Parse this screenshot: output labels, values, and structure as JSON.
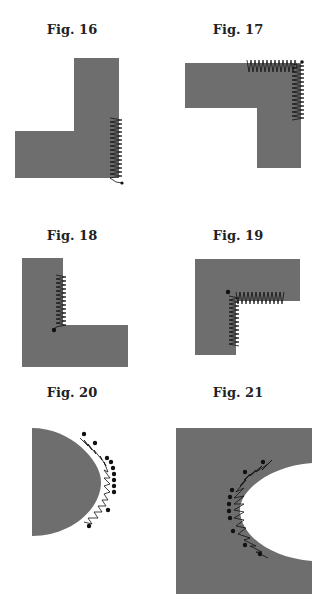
{
  "figures": [
    {
      "id": "fig16",
      "caption": "Fig. 16"
    },
    {
      "id": "fig17",
      "caption": "Fig. 17"
    },
    {
      "id": "fig18",
      "caption": "Fig. 18"
    },
    {
      "id": "fig19",
      "caption": "Fig. 19"
    },
    {
      "id": "fig20",
      "caption": "Fig. 20"
    },
    {
      "id": "fig21",
      "caption": "Fig. 21"
    }
  ],
  "colors": {
    "shape_fill": "#6e6e6e",
    "spring": "#111111",
    "background": "#ffffff"
  }
}
